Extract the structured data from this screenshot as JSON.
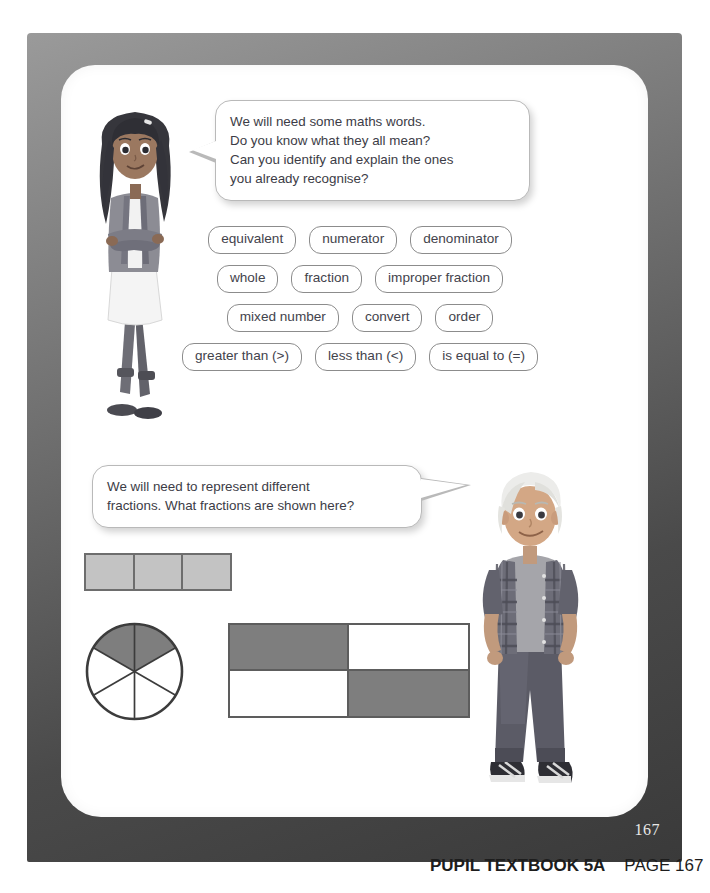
{
  "page": {
    "number": "167",
    "caption_bold": "PUPIL TEXTBOOK 5A",
    "caption_regular": "PAGE 167",
    "frame_color": "#4a4a4a",
    "page_bg": "#ffffff"
  },
  "bubbles": [
    {
      "name": "maths-words-bubble",
      "lines": [
        "We will need some maths words.",
        "Do you know what they all mean?",
        "Can you identify and explain the ones",
        "you already recognise?"
      ]
    },
    {
      "name": "fractions-bubble",
      "lines": [
        "We will need to represent different",
        "fractions. What fractions are shown here?"
      ]
    }
  ],
  "vocabulary": {
    "rows": [
      [
        "equivalent",
        "numerator",
        "denominator"
      ],
      [
        "whole",
        "fraction",
        "improper fraction"
      ],
      [
        "mixed number",
        "convert",
        "order"
      ],
      [
        "greater than (>)",
        "less than (<)",
        "is equal to (=)"
      ]
    ]
  },
  "characters": [
    {
      "name": "girl-character",
      "hair": "#3a3a3a",
      "top": "#8e8e96",
      "skirt": "#f2f2f2"
    },
    {
      "name": "boy-character",
      "hair": "#e4e4e0",
      "shirt": "#6f6f76",
      "tee": "#a8a8ac"
    }
  ],
  "diagrams": {
    "bar": {
      "name": "three-part-bar",
      "parts": 3,
      "shaded": 3,
      "shade_color": "#c3c3c3",
      "stroke_color": "#6d6d6d"
    },
    "circle": {
      "name": "sixths-circle",
      "parts": 6,
      "shaded": 1,
      "shade_color": "#7e7e7e",
      "stroke_color": "#3c3c3c"
    },
    "grid": {
      "name": "quarters-rectangle",
      "parts": 4,
      "shaded": 2,
      "shaded_cells": [
        true,
        false,
        false,
        true
      ],
      "shade_color": "#7e7e7e",
      "stroke_color": "#5d5d5d"
    }
  }
}
